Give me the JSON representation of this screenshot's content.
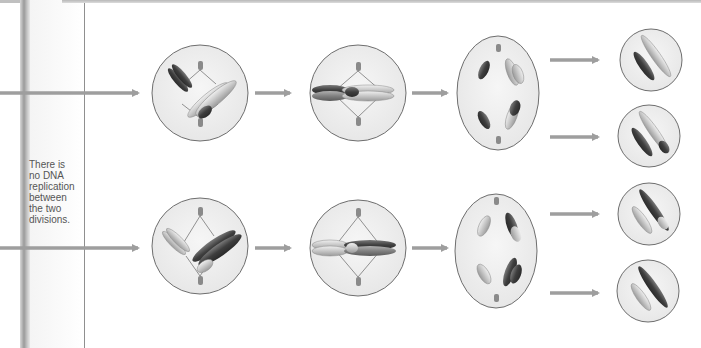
{
  "note": {
    "line1": "There is",
    "line2": "no DNA",
    "line3": "replication",
    "line4": "between",
    "line5": "the two",
    "line6": "divisions."
  },
  "colors": {
    "arrow": "#9e9e9e",
    "cell_fill": "#efefef",
    "cell_stroke": "#6e6e6e",
    "chromosome_dark": "#4a4a4a",
    "chromosome_light": "#c8c8c8",
    "text": "#555555"
  },
  "rows": [
    {
      "name": "top-pathway",
      "stages": [
        "prophase-II",
        "metaphase-II",
        "anaphase-II",
        "daughter-cells"
      ]
    },
    {
      "name": "bottom-pathway",
      "stages": [
        "prophase-II",
        "metaphase-II",
        "anaphase-II",
        "daughter-cells"
      ]
    }
  ]
}
